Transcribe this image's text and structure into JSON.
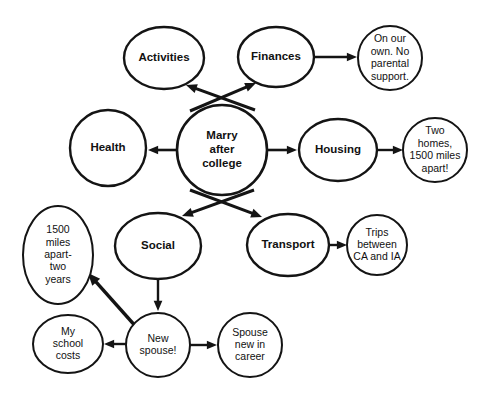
{
  "diagram": {
    "type": "concept-map",
    "background_color": "#ffffff",
    "stroke_color": "#141414",
    "text_color": "#111111",
    "nodes": [
      {
        "id": "marry",
        "label": "Marry after college",
        "lines": [
          "Marry",
          "after",
          "college"
        ],
        "kind": "primary",
        "shape": "circle",
        "cx": 222,
        "cy": 150,
        "rx": 45,
        "ry": 45,
        "stroke_width": 2.6,
        "font_size": 11.5
      },
      {
        "id": "activities",
        "label": "Activities",
        "lines": [
          "Activities"
        ],
        "kind": "primary",
        "shape": "ellipse",
        "cx": 164,
        "cy": 58,
        "rx": 40,
        "ry": 31,
        "stroke_width": 2.4,
        "font_size": 11.5
      },
      {
        "id": "finances",
        "label": "Finances",
        "lines": [
          "Finances"
        ],
        "kind": "primary",
        "shape": "ellipse",
        "cx": 276,
        "cy": 57,
        "rx": 38,
        "ry": 30,
        "stroke_width": 2.4,
        "font_size": 11.5
      },
      {
        "id": "health",
        "label": "Health",
        "lines": [
          "Health"
        ],
        "kind": "primary",
        "shape": "circle",
        "cx": 108,
        "cy": 148,
        "rx": 38,
        "ry": 38,
        "stroke_width": 2.4,
        "font_size": 11.5
      },
      {
        "id": "housing",
        "label": "Housing",
        "lines": [
          "Housing"
        ],
        "kind": "primary",
        "shape": "ellipse",
        "cx": 338,
        "cy": 150,
        "rx": 39,
        "ry": 31,
        "stroke_width": 2.4,
        "font_size": 11.5
      },
      {
        "id": "social",
        "label": "Social",
        "lines": [
          "Social"
        ],
        "kind": "primary",
        "shape": "ellipse",
        "cx": 158,
        "cy": 246,
        "rx": 43,
        "ry": 33,
        "stroke_width": 2.4,
        "font_size": 11.5
      },
      {
        "id": "transport",
        "label": "Transport",
        "lines": [
          "Transport"
        ],
        "kind": "primary",
        "shape": "ellipse",
        "cx": 288,
        "cy": 245,
        "rx": 41,
        "ry": 31,
        "stroke_width": 2.4,
        "font_size": 11.5
      },
      {
        "id": "onourown",
        "label": "On our own. No parental support.",
        "lines": [
          "On our",
          "own. No",
          "parental",
          "support."
        ],
        "kind": "detail",
        "shape": "circle",
        "cx": 390,
        "cy": 58,
        "rx": 32,
        "ry": 32,
        "stroke_width": 2.0,
        "font_size": 10.5
      },
      {
        "id": "twohomes",
        "label": "Two homes, 1500 miles apart!",
        "lines": [
          "Two",
          "homes,",
          "1500 miles",
          "apart!"
        ],
        "kind": "detail",
        "shape": "circle",
        "cx": 435,
        "cy": 150,
        "rx": 32,
        "ry": 32,
        "stroke_width": 2.0,
        "font_size": 10.5
      },
      {
        "id": "trips",
        "label": "Trips between CA and IA",
        "lines": [
          "Trips",
          "between",
          "CA and IA"
        ],
        "kind": "detail",
        "shape": "circle",
        "cx": 377,
        "cy": 245,
        "rx": 30,
        "ry": 30,
        "stroke_width": 2.0,
        "font_size": 10.5
      },
      {
        "id": "milesapart",
        "label": "1500 miles apart- two years",
        "lines": [
          "1500",
          "miles",
          "apart-",
          "two",
          "years"
        ],
        "kind": "detail",
        "shape": "ellipse",
        "cx": 58,
        "cy": 255,
        "rx": 35,
        "ry": 49,
        "stroke_width": 2.0,
        "font_size": 10.5
      },
      {
        "id": "schoolcosts",
        "label": "My school costs",
        "lines": [
          "My",
          "school",
          "costs"
        ],
        "kind": "detail",
        "shape": "ellipse",
        "cx": 68,
        "cy": 344,
        "rx": 35,
        "ry": 29,
        "stroke_width": 2.0,
        "font_size": 10.5
      },
      {
        "id": "newspouse",
        "label": "New spouse!",
        "lines": [
          "New",
          "spouse!"
        ],
        "kind": "detail",
        "shape": "circle",
        "cx": 158,
        "cy": 345,
        "rx": 32,
        "ry": 32,
        "stroke_width": 2.0,
        "font_size": 10.5
      },
      {
        "id": "spousenew",
        "label": "Spouse new in career",
        "lines": [
          "Spouse",
          "new in",
          "career"
        ],
        "kind": "detail",
        "shape": "circle",
        "cx": 250,
        "cy": 345,
        "rx": 32,
        "ry": 32,
        "stroke_width": 2.0,
        "font_size": 10.5
      }
    ],
    "edges": [
      {
        "id": "e1",
        "from": "marry",
        "to": "activities",
        "from_label": "Marry after college",
        "to_label": "Activities",
        "x1": 255,
        "y1": 110,
        "x2": 186,
        "y2": 85,
        "width": 3.0,
        "head": 7.5
      },
      {
        "id": "e2",
        "from": "marry",
        "to": "finances",
        "from_label": "Marry after college",
        "to_label": "Finances",
        "x1": 190,
        "y1": 111,
        "x2": 256,
        "y2": 83,
        "width": 3.0,
        "head": 7.5
      },
      {
        "id": "e3",
        "from": "marry",
        "to": "health",
        "from_label": "Marry after college",
        "to_label": "Health",
        "x1": 177,
        "y1": 150,
        "x2": 148,
        "y2": 150,
        "width": 2.6,
        "head": 7.0
      },
      {
        "id": "e4",
        "from": "marry",
        "to": "housing",
        "from_label": "Marry after college",
        "to_label": "Housing",
        "x1": 267,
        "y1": 150,
        "x2": 297,
        "y2": 150,
        "width": 2.6,
        "head": 7.0
      },
      {
        "id": "e5",
        "from": "marry",
        "to": "social",
        "from_label": "Marry after college",
        "to_label": "Social",
        "x1": 254,
        "y1": 190,
        "x2": 182,
        "y2": 216,
        "width": 3.0,
        "head": 7.5
      },
      {
        "id": "e6",
        "from": "marry",
        "to": "transport",
        "from_label": "Marry after college",
        "to_label": "Transport",
        "x1": 190,
        "y1": 190,
        "x2": 262,
        "y2": 217,
        "width": 3.0,
        "head": 7.5
      },
      {
        "id": "e7",
        "from": "finances",
        "to": "onourown",
        "from_label": "Finances",
        "to_label": "On our own. No parental support.",
        "x1": 314,
        "y1": 57,
        "x2": 357,
        "y2": 57,
        "width": 2.4,
        "head": 7.0
      },
      {
        "id": "e8",
        "from": "housing",
        "to": "twohomes",
        "from_label": "Housing",
        "to_label": "Two homes, 1500 miles apart!",
        "x1": 377,
        "y1": 150,
        "x2": 403,
        "y2": 150,
        "width": 2.4,
        "head": 7.0
      },
      {
        "id": "e9",
        "from": "transport",
        "to": "trips",
        "from_label": "Transport",
        "to_label": "Trips between CA and IA",
        "x1": 329,
        "y1": 245,
        "x2": 347,
        "y2": 245,
        "width": 2.4,
        "head": 7.0
      },
      {
        "id": "e10",
        "from": "social",
        "to": "newspouse",
        "from_label": "Social",
        "to_label": "New spouse!",
        "x1": 158,
        "y1": 279,
        "x2": 158,
        "y2": 311,
        "width": 2.4,
        "head": 7.0
      },
      {
        "id": "e11",
        "from": "newspouse",
        "to": "schoolcosts",
        "from_label": "New spouse!",
        "to_label": "My school costs",
        "x1": 126,
        "y1": 344,
        "x2": 104,
        "y2": 344,
        "width": 2.4,
        "head": 7.0
      },
      {
        "id": "e12",
        "from": "newspouse",
        "to": "spousenew",
        "from_label": "New spouse!",
        "to_label": "Spouse new in career",
        "x1": 190,
        "y1": 345,
        "x2": 217,
        "y2": 345,
        "width": 2.4,
        "head": 7.0
      },
      {
        "id": "e13",
        "from": "newspouse",
        "to": "milesapart",
        "from_label": "New spouse!",
        "to_label": "1500 miles apart- two years",
        "x1": 146,
        "y1": 338,
        "x2": 88,
        "y2": 273,
        "width": 3.4,
        "head": 8.5
      }
    ]
  }
}
